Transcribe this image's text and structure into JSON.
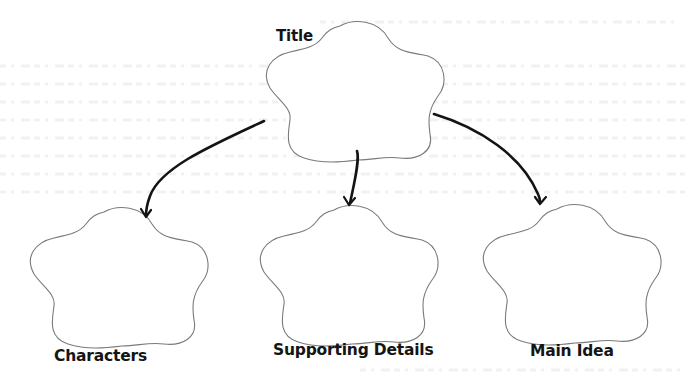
{
  "diagram": {
    "type": "graphic-organizer",
    "root": {
      "label": "Title",
      "shape": "flower-cloud"
    },
    "children": [
      {
        "label": "Characters",
        "shape": "flower-cloud"
      },
      {
        "label": "Supporting Details",
        "shape": "flower-cloud"
      },
      {
        "label": "Main Idea",
        "shape": "flower-cloud"
      }
    ],
    "edges": [
      {
        "from": "Title",
        "to": "Characters"
      },
      {
        "from": "Title",
        "to": "Supporting Details"
      },
      {
        "from": "Title",
        "to": "Main Idea"
      }
    ],
    "colors": {
      "background": "#ffffff",
      "shape_outline": "#7a7a7a",
      "arrow": "#141414",
      "text": "#151515"
    }
  }
}
